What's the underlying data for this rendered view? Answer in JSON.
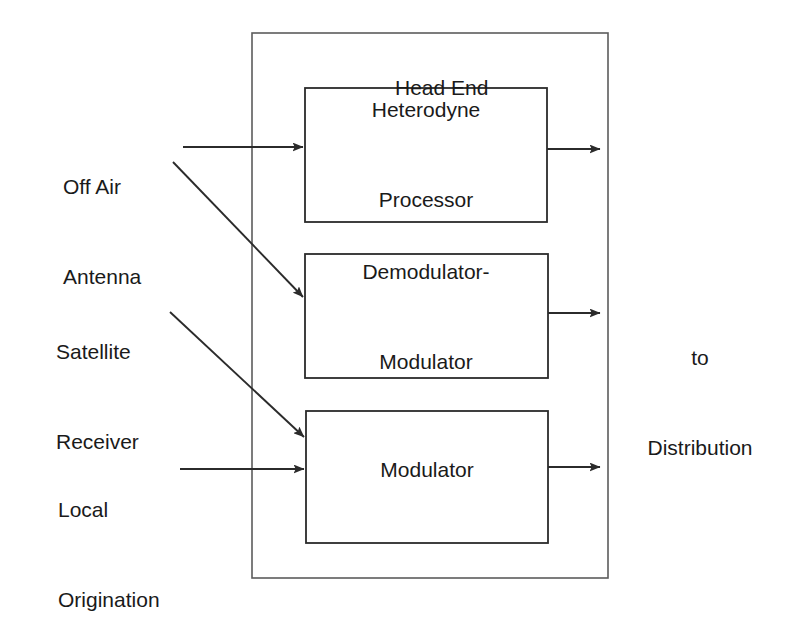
{
  "diagram": {
    "title": "Head End",
    "container_label": "Head End",
    "stroke_color": "#2b2b2b",
    "fill_color": "#ffffff",
    "background_color": "#ffffff",
    "blocks": [
      {
        "id": "heterodyne",
        "label_line1": "Heterodyne",
        "label_line2": "Processor"
      },
      {
        "id": "demod-mod",
        "label_line1": "Demodulator-",
        "label_line2": "Modulator"
      },
      {
        "id": "modulator",
        "label_line1": "Modulator",
        "label_line2": ""
      }
    ],
    "inputs": [
      {
        "id": "off-air-antenna",
        "label_line1": "Off Air",
        "label_line2": "Antenna"
      },
      {
        "id": "satellite-receiver",
        "label_line1": "Satellite",
        "label_line2": "Receiver"
      },
      {
        "id": "local-origination",
        "label_line1": "Local",
        "label_line2": "Origination"
      }
    ],
    "output": {
      "id": "to-distribution",
      "label_line1": "to",
      "label_line2": "Distribution"
    }
  }
}
